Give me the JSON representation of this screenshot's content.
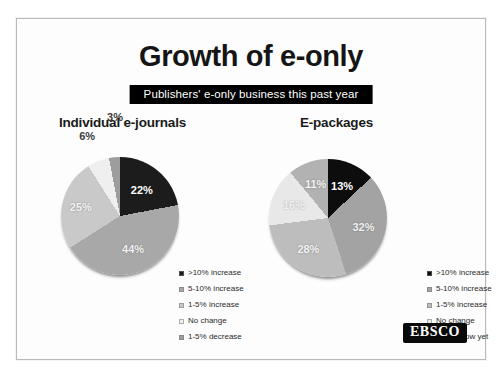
{
  "slide": {
    "title": "Growth of e-only",
    "subtitle_banner": "Publishers'  e-only business this past year",
    "logo": "EBSCO",
    "colors": {
      "banner_background": "#000000",
      "banner_text": "#ffffff",
      "frame_border": "#b9b9b9",
      "background": "#fdfdfd"
    }
  },
  "chart_data": [
    {
      "type": "pie",
      "title": "Individual e-journals",
      "categories": [
        ">10% increase",
        "5-10% increase",
        "1-5% increase",
        "No change",
        "1-5% decrease"
      ],
      "values": [
        22,
        44,
        25,
        6,
        3
      ],
      "labels": [
        "22%",
        "44%",
        "25%",
        "6%",
        "3%"
      ],
      "colors": [
        "#1c1c1c",
        "#a8a8a8",
        "#c9c9c9",
        "#efefef",
        "#9d9d9d"
      ],
      "legend_position": "right",
      "start_angle_deg": 0,
      "grid": false
    },
    {
      "type": "pie",
      "title": "E-packages",
      "categories": [
        ">10% increase",
        "5-10% increase",
        "1-5% increase",
        "No change",
        "Don't know yet"
      ],
      "values": [
        13,
        32,
        28,
        16,
        11
      ],
      "labels": [
        "13%",
        "32%",
        "28%",
        "16%",
        "11%"
      ],
      "colors": [
        "#0d0d0d",
        "#a3a3a3",
        "#bdbdbd",
        "#e8e8e8",
        "#b2b2b2"
      ],
      "legend_position": "right",
      "start_angle_deg": 0,
      "grid": false
    }
  ]
}
